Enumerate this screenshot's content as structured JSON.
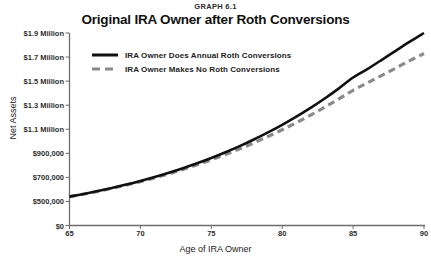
{
  "header": {
    "graph_number": "GRAPH 6.1",
    "title": "Original IRA Owner after Roth Conversions"
  },
  "axes": {
    "ylabel": "Net Assets",
    "xlabel": "Age of IRA Owner"
  },
  "legend": {
    "items": [
      {
        "label": "IRA Owner Does Annual Roth Conversions",
        "style": "solid",
        "color": "#111111"
      },
      {
        "label": "IRA Owner Makes No Roth Conversions",
        "style": "dashed",
        "color": "#8a8a8a"
      }
    ]
  },
  "chart_data": {
    "type": "line",
    "title": "Original IRA Owner after Roth Conversions",
    "subtitle": "GRAPH 6.1",
    "xlabel": "Age of IRA Owner",
    "ylabel": "Net Assets",
    "grid": false,
    "legend_position": "upper-left-inside",
    "x": [
      65,
      66,
      67,
      68,
      69,
      70,
      71,
      72,
      73,
      74,
      75,
      76,
      77,
      78,
      79,
      80,
      81,
      82,
      83,
      84,
      85,
      86,
      87,
      88,
      89,
      90
    ],
    "xlim": [
      65,
      90
    ],
    "xticks": [
      65,
      70,
      75,
      80,
      85,
      90
    ],
    "xticklabels": [
      "65",
      "70",
      "75",
      "80",
      "85",
      "90"
    ],
    "ylim": [
      0,
      1900000
    ],
    "yticks": [
      0,
      500000,
      700000,
      900000,
      1100000,
      1300000,
      1500000,
      1700000,
      1900000
    ],
    "yticklabels": [
      "$0",
      "$500,000",
      "$700,000",
      "$900,000",
      "$1.1 Million",
      "$1.3 Million",
      "$1.5 Million",
      "$1.7 Million",
      "$1.9 Million"
    ],
    "y_axis_note": "Axis is broken between $0 and $500,000; above $500,000 ticks are evenly spaced every $200,000",
    "series": [
      {
        "name": "IRA Owner Does Annual Roth Conversions",
        "style": "solid",
        "color": "#111111",
        "values": [
          540000,
          562000,
          586000,
          612000,
          640000,
          670000,
          703000,
          738000,
          776000,
          817000,
          861000,
          909000,
          960000,
          1015000,
          1074000,
          1137000,
          1205000,
          1278000,
          1356000,
          1440000,
          1530000,
          1600000,
          1675000,
          1752000,
          1828000,
          1900000
        ]
      },
      {
        "name": "IRA Owner Makes No Roth Conversions",
        "style": "dashed",
        "color": "#8a8a8a",
        "values": [
          540000,
          561000,
          584000,
          609000,
          636000,
          665000,
          696000,
          730000,
          766000,
          805000,
          846000,
          890000,
          937000,
          987000,
          1040000,
          1096000,
          1155000,
          1217000,
          1283000,
          1352000,
          1424000,
          1485000,
          1546000,
          1608000,
          1670000,
          1730000
        ]
      }
    ]
  }
}
